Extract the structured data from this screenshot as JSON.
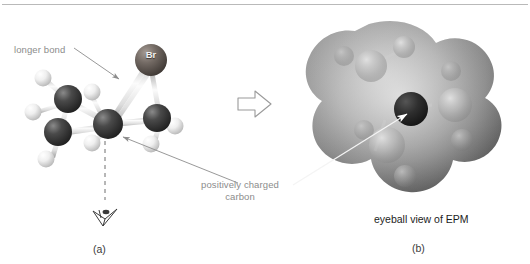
{
  "figure": {
    "background_color": "#ffffff",
    "rule_color": "#b9b9b9",
    "annotation_color": "#8c8c8c",
    "caption_color": "#1c1c1c"
  },
  "annotations": {
    "longer_bond": "longer bond",
    "positively_charged_carbon": "positively charged carbon",
    "positively_charged_carbon_line1": "positively charged",
    "positively_charged_carbon_line2": "carbon"
  },
  "panel_a": {
    "label": "(a)",
    "model_type": "ball-and-stick",
    "atom_labels": [
      {
        "symbol": "Br",
        "color": "#6b625d"
      }
    ],
    "viewing_direction_icon": "eye-icon",
    "carbon_color": "#3c3c3c",
    "hydrogen_color": "#e8e8e8",
    "bromine_color": "#6b625d",
    "bond_color": "#d8d8d8"
  },
  "panel_b": {
    "label": "(b)",
    "caption": "eyeball view of EPM",
    "surface_type": "electrostatic potential map",
    "surface_color_light": "#cfcfcf",
    "surface_color_dark": "#6a6a6a",
    "central_carbon_color": "#2e2e2e"
  },
  "transform_arrow": {
    "icon": "block-arrow-right-icon",
    "fill": "#ffffff",
    "stroke": "#9a9a9a"
  }
}
